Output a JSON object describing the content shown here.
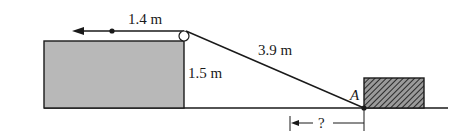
{
  "diagram": {
    "labels": {
      "rope_horizontal": "1.4 m",
      "rope_slant": "3.9 m",
      "box_height": "1.5 m",
      "point_a": "A",
      "unknown_distance": "?"
    },
    "colors": {
      "stroke": "#1a1a1a",
      "box_fill": "#b8b8b8",
      "hatch_bg": "#9a9a9a",
      "hatch_line": "#2a2a2a",
      "background": "#ffffff"
    }
  }
}
